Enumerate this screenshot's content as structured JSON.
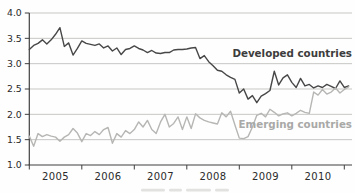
{
  "figure": {
    "series_labels": {
      "developed": "Developed countries",
      "emerging": "Emerging countries"
    },
    "colors": {
      "developed_line": "#474747",
      "emerging_line": "#b6b6b4",
      "developed_label": "#3d3d3d",
      "emerging_label": "#a9a9a7",
      "grid": "#c7c7c5",
      "axis": "#3f3f3f",
      "tick_label": "#2b2b2b",
      "background": "#fefefe"
    }
  },
  "chart_data": {
    "type": "line",
    "title": "",
    "xlabel": "",
    "ylabel": "",
    "x_unit": "monthly",
    "x_start": "2005-01",
    "x_tick_labels": [
      "2005",
      "2006",
      "2007",
      "2008",
      "2009",
      "2010"
    ],
    "y_tick_labels": [
      "4.0",
      "3.5",
      "3.0",
      "2.5",
      "2.0",
      "1.5",
      "1.0"
    ],
    "y_tick_values": [
      4.0,
      3.5,
      3.0,
      2.5,
      2.0,
      1.5,
      1.0
    ],
    "y_gridline_values": [
      4.0,
      3.5,
      3.0,
      2.5,
      2.0,
      1.5
    ],
    "ylim": [
      1.0,
      4.0
    ],
    "grid": "horizontal",
    "legend_position": "inline-right",
    "series": [
      {
        "name": "Developed countries",
        "color": "#474747",
        "values": [
          3.28,
          3.36,
          3.4,
          3.47,
          3.39,
          3.47,
          3.58,
          3.71,
          3.34,
          3.41,
          3.17,
          3.3,
          3.45,
          3.4,
          3.38,
          3.36,
          3.39,
          3.31,
          3.35,
          3.25,
          3.31,
          3.18,
          3.28,
          3.3,
          3.35,
          3.3,
          3.27,
          3.22,
          3.26,
          3.21,
          3.2,
          3.22,
          3.22,
          3.27,
          3.28,
          3.28,
          3.29,
          3.31,
          3.32,
          3.1,
          3.16,
          3.04,
          2.96,
          2.87,
          2.85,
          2.78,
          2.73,
          2.69,
          2.42,
          2.5,
          2.3,
          2.37,
          2.23,
          2.36,
          2.41,
          2.47,
          2.85,
          2.58,
          2.72,
          2.78,
          2.63,
          2.53,
          2.71,
          2.56,
          2.59,
          2.52,
          2.56,
          2.53,
          2.59,
          2.55,
          2.51,
          2.66,
          2.53,
          2.56
        ]
      },
      {
        "name": "Emerging countries",
        "color": "#b6b6b4",
        "values": [
          1.57,
          1.37,
          1.62,
          1.56,
          1.6,
          1.57,
          1.55,
          1.47,
          1.55,
          1.6,
          1.72,
          1.63,
          1.46,
          1.62,
          1.58,
          1.66,
          1.6,
          1.7,
          1.74,
          1.43,
          1.62,
          1.55,
          1.68,
          1.62,
          1.7,
          1.85,
          1.75,
          1.88,
          1.7,
          1.62,
          1.85,
          2.0,
          1.75,
          1.82,
          1.95,
          1.7,
          1.95,
          1.72,
          2.01,
          1.93,
          1.88,
          1.85,
          1.83,
          1.81,
          2.03,
          1.95,
          2.06,
          1.79,
          1.53,
          1.52,
          1.56,
          1.75,
          1.98,
          2.02,
          1.95,
          2.1,
          2.04,
          1.97,
          2.01,
          2.03,
          1.97,
          2.02,
          2.08,
          2.04,
          2.02,
          2.44,
          2.38,
          2.49,
          2.4,
          2.44,
          2.52,
          2.42,
          2.49,
          2.54
        ]
      }
    ]
  }
}
